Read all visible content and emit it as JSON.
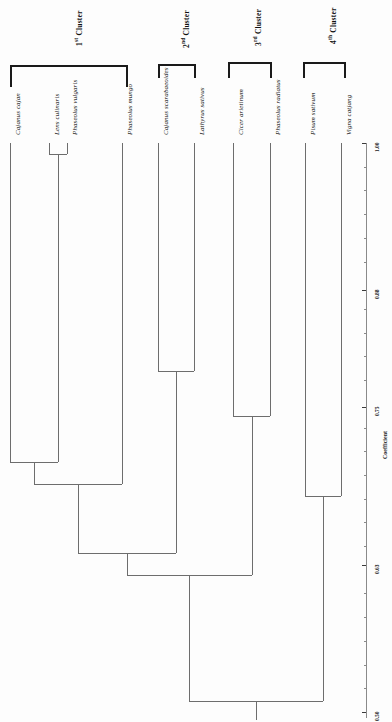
{
  "figure": {
    "orientation": "rotated-90"
  },
  "chart_data": {
    "type": "dendrogram",
    "title": "",
    "xlabel": "",
    "ylabel": "Coefficient",
    "axis_title": "Coefficient",
    "axis_ticks": [
      "1.00",
      "0.88",
      "0.75",
      "0.63",
      "0.50"
    ],
    "axis_range": [
      0.5,
      1.0
    ],
    "grid": false,
    "leaves": [
      {
        "name": "Cajanus cajan",
        "cluster": 1,
        "x": 10
      },
      {
        "name": "Lens culinaris",
        "cluster": 1,
        "x": 49
      },
      {
        "name": "Phaseolus vulgaris",
        "cluster": 1,
        "x": 67
      },
      {
        "name": "Phaseolus mungo",
        "cluster": 1,
        "x": 122
      },
      {
        "name": "Cajanus scarabaeoides",
        "cluster": 2,
        "x": 158
      },
      {
        "name": "Lathyrus sativus",
        "cluster": 2,
        "x": 194
      },
      {
        "name": "Cicer arietinum",
        "cluster": 3,
        "x": 233
      },
      {
        "name": "Phaseolus radiatus",
        "cluster": 3,
        "x": 270
      },
      {
        "name": "Pisum sativum",
        "cluster": 4,
        "x": 305
      },
      {
        "name": "Vigna catjang",
        "cluster": 4,
        "x": 341
      }
    ],
    "merges": [
      {
        "id": "m1",
        "left": "Lens culinaris",
        "right": "Phaseolus vulgaris",
        "coefficient": 0.99
      },
      {
        "id": "m2",
        "left": "Cajanus cajan",
        "right": "m1",
        "coefficient": 0.72
      },
      {
        "id": "m3",
        "left": "m2",
        "right": "Phaseolus mungo",
        "coefficient": 0.7
      },
      {
        "id": "m4",
        "left": "Cajanus scarabaeoides",
        "right": "Lathyrus sativus",
        "coefficient": 0.8
      },
      {
        "id": "m5",
        "left": "Cicer arietinum",
        "right": "Phaseolus radiatus",
        "coefficient": 0.76
      },
      {
        "id": "m6",
        "left": "Pisum sativum",
        "right": "Vigna catjang",
        "coefficient": 0.69
      },
      {
        "id": "m7",
        "left": "m3",
        "right": "m4",
        "coefficient": 0.64
      },
      {
        "id": "m8",
        "left": "m7",
        "right": "m5",
        "coefficient": 0.62
      },
      {
        "id": "m9",
        "left": "m8",
        "right": "m6",
        "coefficient": 0.51
      }
    ]
  },
  "clusters": [
    {
      "id": 1,
      "ordinal": "1",
      "suffix": "st",
      "label": "Cluster",
      "x": 10,
      "width": 118,
      "y": 65,
      "height": 22,
      "label_x": 73,
      "label_y": 46
    },
    {
      "id": 2,
      "ordinal": "2",
      "suffix": "nd",
      "label": "Cluster",
      "x": 158,
      "width": 38,
      "y": 64,
      "height": 14,
      "label_x": 180,
      "label_y": 48
    },
    {
      "id": 3,
      "ordinal": "3",
      "suffix": "rd",
      "label": "Cluster",
      "x": 228,
      "width": 44,
      "y": 62,
      "height": 16,
      "label_x": 252,
      "label_y": 46
    },
    {
      "id": 4,
      "ordinal": "4",
      "suffix": "th",
      "label": "Cluster",
      "x": 303,
      "width": 43,
      "y": 62,
      "height": 16,
      "label_x": 327,
      "label_y": 44
    }
  ],
  "axis": {
    "title": "Coefficient",
    "ticks": [
      {
        "value": "1.00",
        "y": 143
      },
      {
        "value": "0.88",
        "y": 290
      },
      {
        "value": "0.75",
        "y": 407
      },
      {
        "value": "0.63",
        "y": 565
      },
      {
        "value": "0.50",
        "y": 712
      }
    ]
  }
}
